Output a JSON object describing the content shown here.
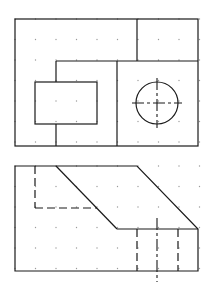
{
  "drawing": {
    "title": "Orthographic projection exercise",
    "grid": {
      "spacing": 20.5,
      "origin_x": 15,
      "origin_y_top": 19,
      "origin_y_bottom": 166,
      "cols": 10,
      "rows_top": 7,
      "rows_bottom": 6,
      "dot_color": "#9a9a9a"
    },
    "line_color": "#1a1a1a",
    "views": [
      {
        "name": "top-view",
        "outer": {
          "x": 15,
          "y": 19,
          "w": 183,
          "h": 127
        },
        "solid_lines": [
          [
            137,
            19,
            137,
            61
          ],
          [
            56,
            61,
            198,
            61
          ],
          [
            56,
            61,
            56,
            82
          ],
          [
            56,
            124,
            56,
            146
          ],
          [
            117,
            61,
            117,
            146
          ]
        ],
        "inner_rect": {
          "x": 35,
          "y": 82,
          "w": 62,
          "h": 42
        },
        "circle": {
          "cx": 157,
          "cy": 103,
          "r": 21
        },
        "centerlines": [
          [
            132,
            103,
            182,
            103
          ],
          [
            157,
            78,
            157,
            128
          ]
        ]
      },
      {
        "name": "front-view",
        "outline_points": "15,166 56,166 137,166 198,229 198,271 15,271",
        "solid_lines": [
          [
            56,
            166,
            117,
            229
          ],
          [
            117,
            229,
            198,
            229
          ]
        ],
        "hidden_lines": [
          [
            35,
            166,
            35,
            208
          ],
          [
            35,
            208,
            97,
            208
          ],
          [
            137,
            229,
            137,
            271
          ],
          [
            178,
            229,
            178,
            271
          ]
        ],
        "centerlines": [
          [
            157,
            218,
            157,
            282
          ]
        ]
      }
    ]
  }
}
